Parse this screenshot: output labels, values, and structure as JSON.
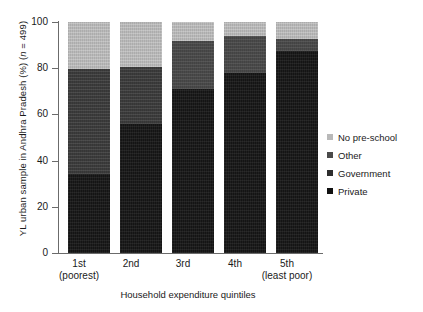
{
  "chart_data": {
    "type": "bar",
    "stacked": true,
    "title": "",
    "subtitle": "",
    "xlabel": "Household expenditure quintiles",
    "ylabel": "YL urban sample in Andhra Pradesh (%) (n = 499)",
    "ylabel_parts": {
      "prefix": "YL urban sample in Andhra Pradesh (%) (",
      "italic": "n",
      "suffix": " = 499)"
    },
    "categories": [
      "1st",
      "2nd",
      "3rd",
      "4th",
      "5th"
    ],
    "category_sublabels": [
      "(poorest)",
      "",
      "",
      "",
      "(least poor)"
    ],
    "ylim": [
      0,
      100
    ],
    "yticks": [
      100,
      80,
      60,
      40,
      20,
      0
    ],
    "ytick_labels": [
      "100",
      "80",
      "60",
      "40",
      "20",
      "0"
    ],
    "grid": false,
    "legend_position": "right",
    "series": [
      {
        "name": "Private",
        "color": "#141414",
        "values": [
          34,
          56,
          71,
          78,
          87.5
        ]
      },
      {
        "name": "Government",
        "color": "#3c3c3c",
        "values": [
          45.5,
          24.5,
          0,
          0,
          0
        ]
      },
      {
        "name": "Other",
        "color": "#4a4a4a",
        "values": [
          0,
          0,
          21,
          16,
          5
        ]
      },
      {
        "name": "No pre-school",
        "color": "#b9b9b9",
        "values": [
          20.5,
          19.5,
          8,
          6,
          7.5
        ]
      }
    ],
    "legend_order": [
      "No pre-school",
      "Other",
      "Government",
      "Private"
    ]
  },
  "legend": {
    "items": [
      {
        "label": "No pre-school",
        "swatch": "nopreschool"
      },
      {
        "label": "Other",
        "swatch": "other"
      },
      {
        "label": "Government",
        "swatch": "government"
      },
      {
        "label": "Private",
        "swatch": "private"
      }
    ]
  },
  "axes": {
    "y_tick_labels": [
      "100",
      "80",
      "60",
      "40",
      "20",
      "0"
    ],
    "x_tick_labels": [
      {
        "main": "1st",
        "sub": "(poorest)"
      },
      {
        "main": "2nd",
        "sub": ""
      },
      {
        "main": "3rd",
        "sub": ""
      },
      {
        "main": "4th",
        "sub": ""
      },
      {
        "main": "5th",
        "sub": "(least poor)"
      }
    ],
    "x_title": "Household expenditure quintiles"
  }
}
